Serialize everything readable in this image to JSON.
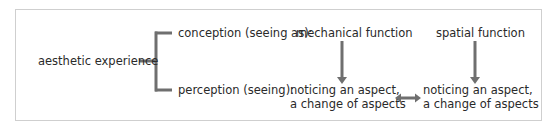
{
  "diagram": {
    "root": "aesthetic experience",
    "branches": {
      "conception": "conception (seeing as):",
      "perception": "perception (seeing):"
    },
    "functions": {
      "mechanical": "mechanical function",
      "spatial": "spatial function"
    },
    "outcomes": {
      "left": {
        "line1": "noticing an aspect,",
        "line2": "a change of aspects"
      },
      "right": {
        "line1": "noticing an aspect,",
        "line2": "a change of aspects"
      }
    },
    "connectors": [
      {
        "from": "aesthetic experience",
        "to": "conception (seeing as)",
        "type": "bracket"
      },
      {
        "from": "aesthetic experience",
        "to": "perception (seeing)",
        "type": "bracket"
      },
      {
        "from": "mechanical function",
        "to": "noticing an aspect, a change of aspects (left)",
        "type": "arrow-down"
      },
      {
        "from": "spatial function",
        "to": "noticing an aspect, a change of aspects (right)",
        "type": "arrow-down"
      },
      {
        "from": "outcome-left",
        "to": "outcome-right",
        "type": "double-arrow"
      }
    ],
    "colors": {
      "line": "#6f6f6f",
      "text": "#2a2a2a",
      "border": "#cfcfcf"
    }
  }
}
